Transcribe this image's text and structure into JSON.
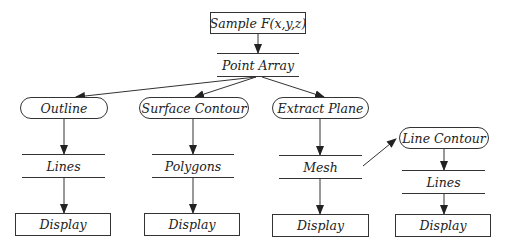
{
  "diagram": {
    "source": {
      "label": "Sample F(x,y,z)"
    },
    "point_array": {
      "label": "Point Array"
    },
    "branches": [
      {
        "filter": "Outline",
        "output": "Lines",
        "sink": "Display"
      },
      {
        "filter": "Surface Contour",
        "output": "Polygons",
        "sink": "Display"
      },
      {
        "filter": "Extract Plane",
        "output": "Mesh",
        "sink": "Display"
      },
      {
        "filter": "Line Contour",
        "output": "Lines",
        "sink": "Display",
        "input_from": "Mesh"
      }
    ],
    "edges": [
      [
        "Sample F(x,y,z)",
        "Point Array"
      ],
      [
        "Point Array",
        "Outline"
      ],
      [
        "Point Array",
        "Surface Contour"
      ],
      [
        "Point Array",
        "Extract Plane"
      ],
      [
        "Outline",
        "Lines"
      ],
      [
        "Lines",
        "Display"
      ],
      [
        "Surface Contour",
        "Polygons"
      ],
      [
        "Polygons",
        "Display"
      ],
      [
        "Extract Plane",
        "Mesh"
      ],
      [
        "Mesh",
        "Display"
      ],
      [
        "Mesh",
        "Line Contour"
      ],
      [
        "Line Contour",
        "Lines"
      ],
      [
        "Lines",
        "Display"
      ]
    ],
    "colors": {
      "stroke": "#333333",
      "text": "#222222",
      "background": "#ffffff"
    }
  }
}
